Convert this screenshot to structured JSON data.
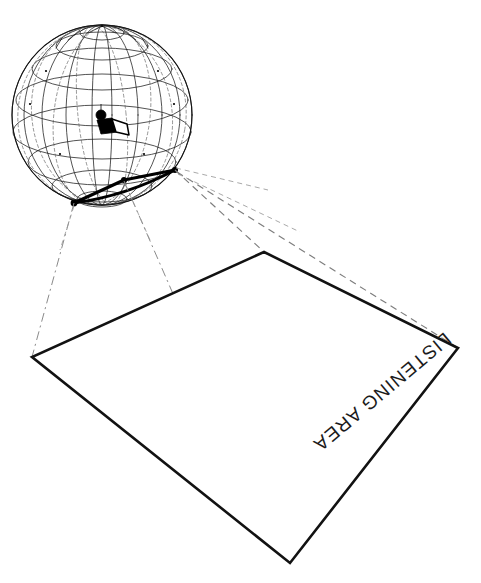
{
  "diagram": {
    "colors": {
      "line": "#121212",
      "wireframe": "#1a1a1a",
      "projection": "#7d7d7d",
      "background": "#ffffff"
    }
  },
  "labels": {
    "listening_area": "LISTENING AREA"
  },
  "source_sphere": {
    "name": "coverage-sphere",
    "center": {
      "x": 102,
      "y": 115
    },
    "radius": 90,
    "meridian_count": 12,
    "parallel_count": 7,
    "tilt_degrees": 22
  },
  "speaker_icon": {
    "name": "loudspeaker-icon",
    "position": {
      "x": 104,
      "y": 120
    },
    "aim_direction": "down-right"
  },
  "coverage_arc": {
    "name": "coverage-arc",
    "points": [
      {
        "x": 74,
        "y": 203
      },
      {
        "x": 124,
        "y": 180
      },
      {
        "x": 175,
        "y": 170
      }
    ]
  },
  "listening_area_quad": {
    "name": "listening-area-quad",
    "corners": [
      {
        "label": "top",
        "x": 264,
        "y": 252
      },
      {
        "label": "right",
        "x": 458,
        "y": 348
      },
      {
        "label": "bottom",
        "x": 290,
        "y": 563
      },
      {
        "label": "left",
        "x": 32,
        "y": 357
      }
    ]
  },
  "projection_rays": [
    {
      "name": "ray-arc-right-to-top-corner",
      "from": {
        "x": 175,
        "y": 170
      },
      "to": {
        "x": 264,
        "y": 252
      },
      "style": "dashed"
    },
    {
      "name": "ray-arc-right-to-right-corner",
      "from": {
        "x": 177,
        "y": 172
      },
      "to": {
        "x": 458,
        "y": 348
      },
      "style": "dashed"
    },
    {
      "name": "ray-arc-left-to-left-corner",
      "from": {
        "x": 74,
        "y": 203
      },
      "to": {
        "x": 32,
        "y": 357
      },
      "style": "dashdot"
    },
    {
      "name": "ray-arc-mid-to-bottom-corner",
      "from": {
        "x": 124,
        "y": 181
      },
      "to": {
        "x": 290,
        "y": 563
      },
      "style": "dashdot"
    }
  ]
}
